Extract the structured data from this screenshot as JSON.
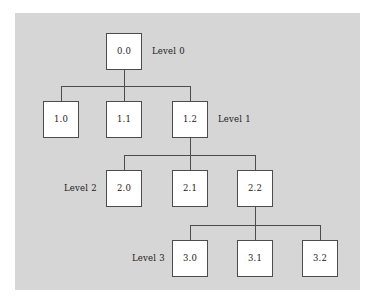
{
  "figure": {
    "panel_background": "#d6d6d6",
    "page_background": "#ffffff",
    "node_fill": "#ffffff",
    "node_stroke": "#4c4c4c",
    "edge_stroke": "#4c4c4c",
    "text_color": "#1a1a1a"
  },
  "levels": [
    {
      "label": "Level 0",
      "label_side": "right"
    },
    {
      "label": "Level 1",
      "label_side": "right"
    },
    {
      "label": "Level 2",
      "label_side": "left"
    },
    {
      "label": "Level 3",
      "label_side": "left"
    }
  ],
  "nodes": {
    "n00": "0.0",
    "n10": "1.0",
    "n11": "1.1",
    "n12": "1.2",
    "n20": "2.0",
    "n21": "2.1",
    "n22": "2.2",
    "n30": "3.0",
    "n31": "3.1",
    "n32": "3.2"
  },
  "tree": {
    "root": "0.0",
    "edges": [
      [
        "0.0",
        "1.0"
      ],
      [
        "0.0",
        "1.1"
      ],
      [
        "0.0",
        "1.2"
      ],
      [
        "1.2",
        "2.0"
      ],
      [
        "1.2",
        "2.1"
      ],
      [
        "1.2",
        "2.2"
      ],
      [
        "2.2",
        "3.0"
      ],
      [
        "2.2",
        "3.1"
      ],
      [
        "2.2",
        "3.2"
      ]
    ]
  }
}
